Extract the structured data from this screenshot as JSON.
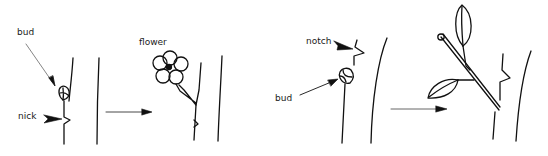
{
  "diagram": {
    "colors": {
      "ink": "#111111",
      "arrow_gray": "#555555",
      "background": "#ffffff"
    },
    "panels": [
      {
        "id": "flower-bud",
        "labels": {
          "bud": "bud",
          "nick": "nick",
          "result": "flower"
        }
      },
      {
        "id": "leaf-bud",
        "labels": {
          "notch": "notch",
          "bud": "bud"
        }
      }
    ]
  }
}
